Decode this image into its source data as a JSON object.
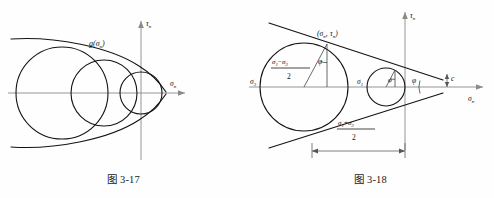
{
  "document": {
    "kind": "textbook-figure-pair",
    "background_color": "#fefefe",
    "ink_color": "#141414",
    "axis_color": "#8a8a8a"
  },
  "figure_left": {
    "caption": "图 3-17",
    "axis_x_label": "σ",
    "axis_x_sub": "n",
    "axis_y_label": "τ",
    "axis_y_sub": "n",
    "envelope_label": "g(σ",
    "envelope_label_sub": "n",
    "envelope_label_tail": ")",
    "description": "Three Mohr circles of different radii tangent to a common curved strength envelope g(σn)",
    "circles": [
      {
        "cx": 62,
        "cy": 93,
        "r": 46
      },
      {
        "cx": 104,
        "cy": 93,
        "r": 33
      },
      {
        "cx": 141,
        "cy": 93,
        "r": 21
      }
    ]
  },
  "figure_right": {
    "caption": "图 3-18",
    "axis_x_label": "σ",
    "axis_x_sub": "n",
    "axis_y_label": "τ",
    "axis_y_sub": "n",
    "point_label_open": "(",
    "point_label_sigma": "σ",
    "point_label_sigma_sub": "n",
    "point_label_comma": ",",
    "point_label_tau": "τ",
    "point_label_tau_sub": "n",
    "point_label_close": ")",
    "sigma3_label": "σ",
    "sigma3_sub": "3",
    "sigma1_label": "σ",
    "sigma1_sub": "1",
    "radius_numerator_a": "σ",
    "radius_numerator_a_sub": "1",
    "radius_numerator_minus": "−",
    "radius_numerator_b": "σ",
    "radius_numerator_b_sub": "3",
    "radius_denominator": "2",
    "center_numerator_a": "σ",
    "center_numerator_a_sub": "1",
    "center_numerator_plus": "+",
    "center_numerator_b": "σ",
    "center_numerator_b_sub": "3",
    "center_denominator": "2",
    "phi_label": "φ",
    "phi_small_label": "φ",
    "phi_apex_label": "φ",
    "cohesion_label": "c",
    "description": "Mohr-Coulomb failure criterion: large stress circle (σ3..σ1) and a small circle both tangent to the straight strength envelope converging at the apex; intercept c on the τn axis"
  }
}
